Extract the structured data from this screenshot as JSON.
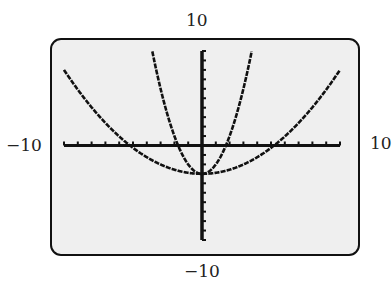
{
  "window": {
    "xmin": -10,
    "xmax": 10,
    "ymin": -10,
    "ymax": 10,
    "xscl": 1,
    "yscl": 1
  },
  "labels": {
    "ymax": "10",
    "ymin": "−10",
    "xmin": "−10",
    "xmax": "10"
  },
  "colors": {
    "screen_bg": "#efefef",
    "ink": "#111111",
    "label": "#222222"
  },
  "chart_data": {
    "type": "line",
    "title": "",
    "xlabel": "",
    "ylabel": "",
    "xlim": [
      -10,
      10
    ],
    "ylim": [
      -10,
      10
    ],
    "grid": false,
    "legend": "none",
    "tick_labels": {
      "x": [
        "−10",
        "10"
      ],
      "y": [
        "−10",
        "10"
      ]
    },
    "series": [
      {
        "name": "narrow parabola",
        "equation": "y = x^2 - 3",
        "a": 1,
        "k": -3,
        "x": [
          -3.6,
          -3,
          -2,
          -1.73,
          -1,
          0,
          1,
          1.73,
          2,
          3,
          3.6
        ],
        "values": [
          10,
          6,
          1,
          0,
          -2,
          -3,
          -2,
          0,
          1,
          6,
          10
        ]
      },
      {
        "name": "wide parabola",
        "equation": "y = 0.11x^2 - 3",
        "a": 0.11,
        "k": -3,
        "x": [
          -10,
          -8,
          -6,
          -5.2,
          -4,
          -2,
          0,
          2,
          4,
          5.2,
          6,
          8,
          10
        ],
        "values": [
          8,
          4,
          1,
          0,
          -1.2,
          -2.6,
          -3,
          -2.6,
          -1.2,
          0,
          1,
          4,
          8
        ]
      }
    ]
  }
}
